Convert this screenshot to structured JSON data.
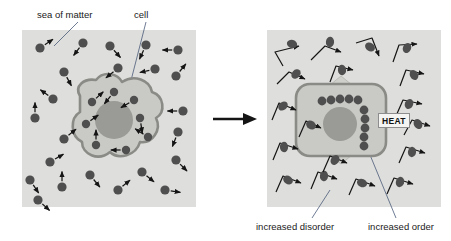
{
  "figure": {
    "transition_arrow": "arrow-right"
  },
  "labels": {
    "sea_of_matter": "sea of matter",
    "cell": "cell",
    "increased_disorder": "increased disorder",
    "increased_order": "increased order",
    "heat": "HEAT"
  },
  "colors": {
    "panel_bg": "#dededc",
    "particle": "#4f4f4f",
    "cell_fill": "#c9c9c6",
    "cell_membrane": "#8a8a86",
    "nucleus": "#9a9a96",
    "heat_arrow": "#cfcfcb",
    "arrow_stroke": "#151515",
    "leader_line": "#4a5a78"
  },
  "panels": {
    "left": {
      "name": "before-state",
      "description": "cell in sea of matter with randomly moving particles",
      "x": 22,
      "y": 30,
      "width": 174,
      "height": 177,
      "free_particles": [
        {
          "x": 40,
          "y": 48,
          "ax": 12,
          "ay": -8
        },
        {
          "x": 64,
          "y": 72,
          "ax": 7,
          "ay": 13
        },
        {
          "x": 83,
          "y": 43,
          "ax": -9,
          "ay": 12
        },
        {
          "x": 110,
          "y": 46,
          "ax": 10,
          "ay": 11
        },
        {
          "x": 118,
          "y": 68,
          "ax": -11,
          "ay": 9
        },
        {
          "x": 146,
          "y": 45,
          "ax": -6,
          "ay": 13
        },
        {
          "x": 155,
          "y": 69,
          "ax": -13,
          "ay": 3
        },
        {
          "x": 178,
          "y": 50,
          "ax": -14,
          "ay": 0
        },
        {
          "x": 176,
          "y": 76,
          "ax": 9,
          "ay": -11
        },
        {
          "x": 53,
          "y": 99,
          "ax": -11,
          "ay": -8
        },
        {
          "x": 35,
          "y": 118,
          "ax": 0,
          "ay": -14
        },
        {
          "x": 64,
          "y": 139,
          "ax": 11,
          "ay": -9
        },
        {
          "x": 183,
          "y": 111,
          "ax": -14,
          "ay": 0
        },
        {
          "x": 178,
          "y": 132,
          "ax": -5,
          "ay": 13
        },
        {
          "x": 50,
          "y": 162,
          "ax": 12,
          "ay": -7
        },
        {
          "x": 176,
          "y": 160,
          "ax": 10,
          "ay": 10
        },
        {
          "x": 30,
          "y": 180,
          "ax": 8,
          "ay": 12
        },
        {
          "x": 62,
          "y": 187,
          "ax": 0,
          "ay": -14
        },
        {
          "x": 90,
          "y": 175,
          "ax": 9,
          "ay": 11
        },
        {
          "x": 118,
          "y": 190,
          "ax": 11,
          "ay": -9
        },
        {
          "x": 142,
          "y": 172,
          "ax": 11,
          "ay": 9
        },
        {
          "x": 165,
          "y": 190,
          "ax": 13,
          "ay": 2
        },
        {
          "x": 38,
          "y": 200,
          "ax": 10,
          "ay": 9
        }
      ],
      "cell_particles": [
        {
          "x": 92,
          "y": 102,
          "ax": 10,
          "ay": -9
        },
        {
          "x": 114,
          "y": 92,
          "ax": -9,
          "ay": 11
        },
        {
          "x": 134,
          "y": 100,
          "ax": -12,
          "ay": 7
        },
        {
          "x": 86,
          "y": 124,
          "ax": 11,
          "ay": -8
        },
        {
          "x": 140,
          "y": 118,
          "ax": 2,
          "ay": 13
        },
        {
          "x": 96,
          "y": 145,
          "ax": 0,
          "ay": -13
        },
        {
          "x": 126,
          "y": 150,
          "ax": -13,
          "ay": 0
        },
        {
          "x": 148,
          "y": 137,
          "ax": -11,
          "ay": -7
        }
      ]
    },
    "right": {
      "name": "after-state",
      "description": "cell with ordered particle chains releasing heat, surroundings in increased disorder",
      "x": 267,
      "y": 30,
      "width": 174,
      "height": 177,
      "ordered_chain_horizontal": [
        {
          "x": 322,
          "y": 101
        },
        {
          "x": 331,
          "y": 100
        },
        {
          "x": 340,
          "y": 99
        },
        {
          "x": 349,
          "y": 99
        },
        {
          "x": 358,
          "y": 100
        }
      ],
      "ordered_chain_vertical": [
        {
          "x": 364,
          "y": 110
        },
        {
          "x": 365,
          "y": 119
        },
        {
          "x": 365,
          "y": 128
        },
        {
          "x": 364,
          "y": 137
        },
        {
          "x": 364,
          "y": 146
        }
      ],
      "heat_arrows": [
        "up",
        "down",
        "left",
        "right"
      ],
      "disorder_paths": [
        {
          "blob": {
            "x": 292,
            "y": 44
          },
          "path": "M 283 66 L 275 52 L 299 46"
        },
        {
          "blob": {
            "x": 330,
            "y": 42
          },
          "path": "M 311 60 L 325 46 L 341 52"
        },
        {
          "blob": {
            "x": 370,
            "y": 47
          },
          "path": "M 356 43 L 372 38 L 379 56"
        },
        {
          "blob": {
            "x": 407,
            "y": 48
          },
          "path": "M 393 62 L 399 45 L 417 44"
        },
        {
          "blob": {
            "x": 296,
            "y": 74
          },
          "path": "M 277 84 L 289 72 L 305 79"
        },
        {
          "blob": {
            "x": 342,
            "y": 70
          },
          "path": "M 330 82 L 336 66 L 353 70"
        },
        {
          "blob": {
            "x": 414,
            "y": 75
          },
          "path": "M 400 86 L 406 70 L 424 74"
        },
        {
          "blob": {
            "x": 283,
            "y": 106
          },
          "path": "M 272 120 L 279 103 L 296 110"
        },
        {
          "blob": {
            "x": 409,
            "y": 104
          },
          "path": "M 396 116 L 403 100 L 422 104"
        },
        {
          "blob": {
            "x": 418,
            "y": 124
          },
          "path": "M 404 135 L 412 120 L 430 126"
        },
        {
          "blob": {
            "x": 284,
            "y": 147
          },
          "path": "M 273 160 L 280 143 L 298 149"
        },
        {
          "blob": {
            "x": 412,
            "y": 152
          },
          "path": "M 399 163 L 406 147 L 425 153"
        },
        {
          "blob": {
            "x": 288,
            "y": 180
          },
          "path": "M 276 192 L 283 176 L 301 183"
        },
        {
          "blob": {
            "x": 324,
            "y": 176
          },
          "path": "M 311 189 L 318 172 L 337 179"
        },
        {
          "blob": {
            "x": 362,
            "y": 183
          },
          "path": "M 349 195 L 356 179 L 375 186"
        },
        {
          "blob": {
            "x": 400,
            "y": 182
          },
          "path": "M 387 194 L 394 178 L 413 184"
        },
        {
          "blob": {
            "x": 311,
            "y": 125
          },
          "path": "M 299 137 L 306 121 L 321 128"
        },
        {
          "blob": {
            "x": 335,
            "y": 160
          },
          "path": "M 323 172 L 330 156 L 347 163"
        }
      ]
    }
  }
}
